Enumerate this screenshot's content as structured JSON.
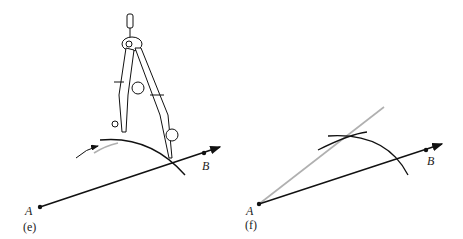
{
  "panels": [
    {
      "id": "e",
      "caption": "(e)",
      "point_a": "A",
      "point_b": "B",
      "description": "Compass swinging an arc from point on AB"
    },
    {
      "id": "f",
      "caption": "(f)",
      "point_a": "A",
      "point_b": "B",
      "description": "Intersecting arcs with gray line drawn from A"
    }
  ],
  "colors": {
    "ink": "#111111",
    "construction_line": "#b0b0b0"
  }
}
